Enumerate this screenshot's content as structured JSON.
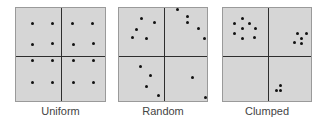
{
  "panels": [
    {
      "id": "uniform",
      "label": "Uniform",
      "box": {
        "left": 15,
        "width": 91
      },
      "divider": {
        "x": 45,
        "y": 48
      },
      "dots": [
        [
          16,
          15
        ],
        [
          36,
          15
        ],
        [
          56,
          15
        ],
        [
          76,
          15
        ],
        [
          16,
          36
        ],
        [
          36,
          35
        ],
        [
          57,
          36
        ],
        [
          77,
          35
        ],
        [
          16,
          52
        ],
        [
          36,
          52
        ],
        [
          57,
          52
        ],
        [
          77,
          52
        ],
        [
          16,
          74
        ],
        [
          36,
          74
        ],
        [
          57,
          74
        ],
        [
          77,
          74
        ]
      ]
    },
    {
      "id": "random",
      "label": "Random",
      "box": {
        "left": 118,
        "width": 90
      },
      "divider": {
        "x": 45,
        "y": 48
      },
      "dots": [
        [
          22,
          10
        ],
        [
          35,
          14
        ],
        [
          17,
          21
        ],
        [
          13,
          29
        ],
        [
          27,
          30
        ],
        [
          58,
          1
        ],
        [
          68,
          8
        ],
        [
          68,
          14
        ],
        [
          79,
          20
        ],
        [
          85,
          30
        ],
        [
          21,
          58
        ],
        [
          31,
          67
        ],
        [
          27,
          78
        ],
        [
          39,
          87
        ],
        [
          73,
          69
        ],
        [
          86,
          89
        ]
      ]
    },
    {
      "id": "clumped",
      "label": "Clumped",
      "box": {
        "left": 222,
        "width": 90
      },
      "divider": {
        "x": 45,
        "y": 48
      },
      "dots": [
        [
          19,
          10
        ],
        [
          11,
          15
        ],
        [
          26,
          15
        ],
        [
          19,
          20
        ],
        [
          32,
          20
        ],
        [
          11,
          25
        ],
        [
          19,
          30
        ],
        [
          31,
          29
        ],
        [
          74,
          25
        ],
        [
          83,
          25
        ],
        [
          78,
          30
        ],
        [
          71,
          34
        ],
        [
          78,
          35
        ],
        [
          57,
          77
        ],
        [
          53,
          82
        ],
        [
          57,
          82
        ]
      ]
    }
  ],
  "colors": {
    "panel_fill": "#d6d6d6",
    "divider": "#2e2e2e",
    "dot": "#111111",
    "label": "#444444"
  }
}
